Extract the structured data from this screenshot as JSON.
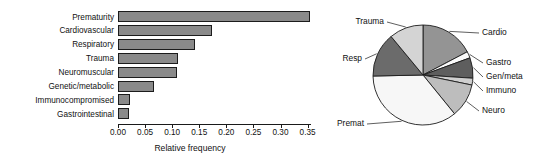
{
  "chart_data": [
    {
      "type": "bar",
      "orientation": "horizontal",
      "title": "",
      "xlabel": "Relative frequency",
      "ylabel": "",
      "xlim": [
        0.0,
        0.36
      ],
      "xticks": [
        0.0,
        0.05,
        0.1,
        0.15,
        0.2,
        0.25,
        0.3,
        0.35
      ],
      "xtick_labels": [
        "0.00",
        "0.05",
        "0.10",
        "0.15",
        "0.20",
        "0.25",
        "0.30",
        "0.35"
      ],
      "grid": false,
      "legend": "none",
      "bar_fill": "#8a8a8a",
      "bar_edge": "#1c1c1c",
      "categories": [
        "Prematurity",
        "Cardiovascular",
        "Respiratory",
        "Trauma",
        "Neuromuscular",
        "Genetic/metabolic",
        "Immunocompromised",
        "Gastrointestinal"
      ],
      "values": [
        0.355,
        0.173,
        0.143,
        0.11,
        0.109,
        0.066,
        0.022,
        0.021
      ]
    },
    {
      "type": "pie",
      "title": "",
      "start_angle_deg": 90,
      "direction": "clockwise",
      "labels": [
        "Cardio",
        "Gastro",
        "Gen/meta",
        "Immuno",
        "Neuro",
        "Premat",
        "Resp",
        "Trauma"
      ],
      "values": [
        0.173,
        0.021,
        0.066,
        0.022,
        0.109,
        0.355,
        0.143,
        0.11
      ],
      "colors": [
        "#949494",
        "#fbfbfb",
        "#5e5e5e",
        "#cfcfcf",
        "#bdbdbd",
        "#f7f7f7",
        "#6b6b6b",
        "#d4d4d4"
      ],
      "edge_color": "#1c1c1c",
      "label_positions": [
        "upper-right",
        "right",
        "right",
        "right",
        "lower-right",
        "lower-left",
        "left",
        "upper-left"
      ]
    }
  ],
  "barchart": {
    "axis_title": "Relative frequency",
    "tick_labels": [
      "0.00",
      "0.05",
      "0.10",
      "0.15",
      "0.20",
      "0.25",
      "0.30",
      "0.35"
    ],
    "categories": [
      {
        "label": "Prematurity",
        "value": 0.355
      },
      {
        "label": "Cardiovascular",
        "value": 0.173
      },
      {
        "label": "Respiratory",
        "value": 0.143
      },
      {
        "label": "Trauma",
        "value": 0.11
      },
      {
        "label": "Neuromuscular",
        "value": 0.109
      },
      {
        "label": "Genetic/metabolic",
        "value": 0.066
      },
      {
        "label": "Immunocompromised",
        "value": 0.022
      },
      {
        "label": "Gastrointestinal",
        "value": 0.021
      }
    ]
  },
  "piechart": {
    "slices": [
      {
        "label": "Cardio",
        "value": 0.173,
        "color": "#949494"
      },
      {
        "label": "Gastro",
        "value": 0.021,
        "color": "#fbfbfb"
      },
      {
        "label": "Gen/meta",
        "value": 0.066,
        "color": "#5e5e5e"
      },
      {
        "label": "Immuno",
        "value": 0.022,
        "color": "#cfcfcf"
      },
      {
        "label": "Neuro",
        "value": 0.109,
        "color": "#bdbdbd"
      },
      {
        "label": "Premat",
        "value": 0.355,
        "color": "#f7f7f7"
      },
      {
        "label": "Resp",
        "value": 0.143,
        "color": "#6b6b6b"
      },
      {
        "label": "Trauma",
        "value": 0.11,
        "color": "#d4d4d4"
      }
    ]
  }
}
